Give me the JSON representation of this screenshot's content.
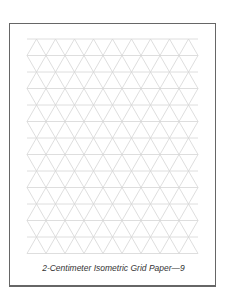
{
  "page": {
    "caption": "2-Centimeter Isometric Grid Paper—9",
    "grid": {
      "type": "isometric-triangle",
      "left": 27,
      "top": 39,
      "tri_width": 19,
      "row_height": 16.5,
      "cols": 9,
      "rows": 13,
      "line_color": "#d6d6d6"
    },
    "frame_color": "#666666"
  }
}
